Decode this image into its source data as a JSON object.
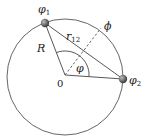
{
  "diagram": {
    "labels": {
      "phi1": "φ",
      "phi1_sub": "1",
      "phi2": "φ",
      "phi2_sub": "2",
      "phi_big": "ϕ",
      "r12": "r",
      "r12_sub": "12",
      "R": "R",
      "angle": "φ",
      "origin": "0"
    },
    "colors": {
      "stroke": "#444444",
      "ball": "#6e6e6e",
      "text": "#222222"
    }
  }
}
